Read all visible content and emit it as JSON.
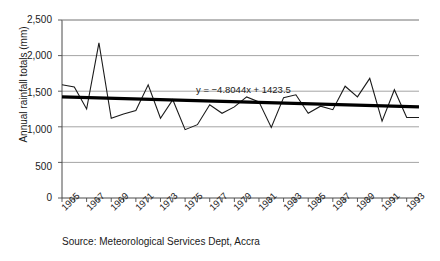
{
  "chart_data": {
    "type": "line",
    "title": "",
    "subtitle": "",
    "xlabel": "",
    "ylabel": "Annual rainfall totals (mm)",
    "ylim": [
      0,
      2500
    ],
    "ytick_values": [
      0,
      500,
      1000,
      1500,
      2000,
      2500
    ],
    "ytick_labels": [
      "0",
      "500",
      "1,000",
      "1,500",
      "2,000",
      "2,500"
    ],
    "grid": true,
    "legend": "none",
    "xlim": [
      1965,
      1994
    ],
    "xtick_labels": [
      "1965",
      "1967",
      "1969",
      "1971",
      "1973",
      "1975",
      "1977",
      "1979",
      "1981",
      "1983",
      "1985",
      "1987",
      "1989",
      "1991",
      "1993"
    ],
    "xtick_step_years": 2,
    "x": [
      1965,
      1966,
      1967,
      1968,
      1969,
      1970,
      1971,
      1972,
      1973,
      1974,
      1975,
      1976,
      1977,
      1978,
      1979,
      1980,
      1981,
      1982,
      1983,
      1984,
      1985,
      1986,
      1987,
      1988,
      1989,
      1990,
      1991,
      1992,
      1993,
      1994
    ],
    "series": [
      {
        "name": "Annual rainfall total",
        "color": "#1a1a1a",
        "values": [
          1590,
          1560,
          1250,
          2180,
          1120,
          1180,
          1230,
          1590,
          1120,
          1380,
          960,
          1030,
          1310,
          1190,
          1280,
          1420,
          1350,
          990,
          1410,
          1450,
          1190,
          1290,
          1240,
          1570,
          1420,
          1680,
          1080,
          1520,
          1130,
          1130
        ]
      }
    ],
    "trendline": {
      "equation": "y = −4.8044x + 1423.5",
      "slope": -4.8044,
      "intercept": 1423.5,
      "color": "#000000",
      "start": {
        "x": 1965,
        "y": 1419
      },
      "end": {
        "x": 1994,
        "y": 1280
      }
    },
    "annotation": "y = −4.8044x + 1423.5",
    "source": "Source: Meteorological Services Dept, Accra"
  }
}
